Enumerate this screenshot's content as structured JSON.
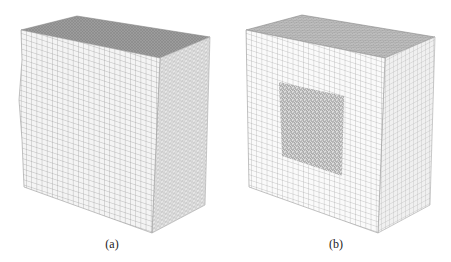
{
  "figure": {
    "panels": [
      {
        "id": "a",
        "caption": "(a)",
        "description": "Cube fully meshed: front face structured hexahedral-like grid with irregular distorted edges, top and right faces unstructured tetrahedral mesh",
        "colors": {
          "front": "#f4f4f4",
          "top": "#9a9a9a",
          "side": "#e6e6e6",
          "grid": "#8a8a8a"
        }
      },
      {
        "id": "b",
        "caption": "(b)",
        "description": "Cube with structured regular grid on all faces and an unstructured dense mesh patch embedded in the center of the front face",
        "colors": {
          "front": "#fafafa",
          "top": "#b4b4b4",
          "side": "#eeeeee",
          "grid": "#9a9a9a",
          "patch": "#6e6e6e"
        }
      }
    ]
  }
}
